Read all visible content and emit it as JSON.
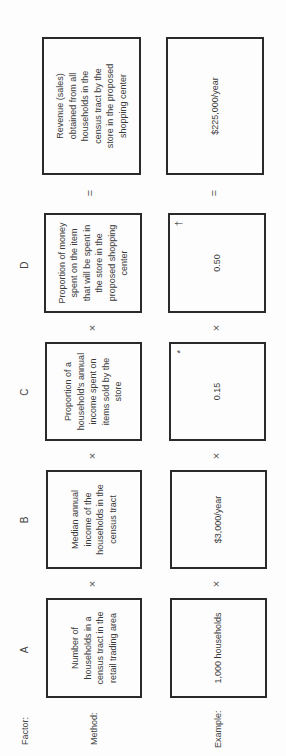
{
  "rows": {
    "factor_label": "Factor:",
    "method_label": "Method:",
    "example_label": "Example:"
  },
  "factors": [
    {
      "letter": "A",
      "method": "Number of households in a census tract in the retail trading area",
      "example": "1,000 households"
    },
    {
      "letter": "B",
      "method": "Median annual income of the households in the census tract",
      "example": "$3,000/year"
    },
    {
      "letter": "C",
      "method": "Proportion of a household's annual income spent on items sold by the store",
      "example": "0.15",
      "example_mark": "*"
    },
    {
      "letter": "D",
      "method": "Proportion of money spent on the item that will be spent in the store in the proposed shopping center",
      "example": "0.50",
      "example_mark": "†"
    }
  ],
  "result": {
    "method": "Revenue (sales) obtained from all households in the census tract by the store in the proposed shopping center",
    "example": "$225,000/year"
  },
  "operators": {
    "multiply": "×",
    "equals": "="
  }
}
